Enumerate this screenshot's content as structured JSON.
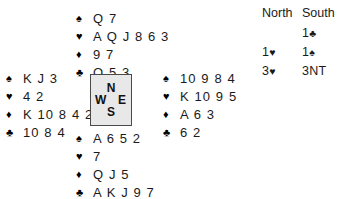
{
  "deal": {
    "suit_symbols": {
      "spade": "♠",
      "heart": "♥",
      "diamond": "♦",
      "club": "♣"
    },
    "hands": {
      "north": {
        "label": "North",
        "spades": "Q 7",
        "hearts": "A Q J 8 6 3",
        "diamonds": "9 7",
        "clubs": "Q 5 3"
      },
      "west": {
        "label": "West",
        "spades": "K J 3",
        "hearts": "4 2",
        "diamonds": "K 10 8 4 2",
        "clubs": "10 8 4"
      },
      "east": {
        "label": "East",
        "spades": "10 9 8 4",
        "hearts": "K 10 9 5",
        "diamonds": "A 6 3",
        "clubs": "6 2"
      },
      "south": {
        "label": "South",
        "spades": "A 6 5 2",
        "hearts": "7",
        "diamonds": "Q J 5",
        "clubs": "A K J 9 7"
      }
    }
  },
  "compass": {
    "north": "N",
    "south": "S",
    "east": "E",
    "west": "W"
  },
  "auction": {
    "headers": [
      "North",
      "South"
    ],
    "rows": [
      {
        "north": "",
        "north_suit": "",
        "south": "1",
        "south_suit": "♣"
      },
      {
        "north": "1",
        "north_suit": "♥",
        "south": "1",
        "south_suit": "♠"
      },
      {
        "north": "3",
        "north_suit": "♥",
        "south": "3NT",
        "south_suit": ""
      }
    ]
  },
  "colors": {
    "background": "#ffffff",
    "text": "#1a1a1a",
    "compass_fill": "#e8e8e8",
    "compass_border": "#4a4a4a"
  }
}
